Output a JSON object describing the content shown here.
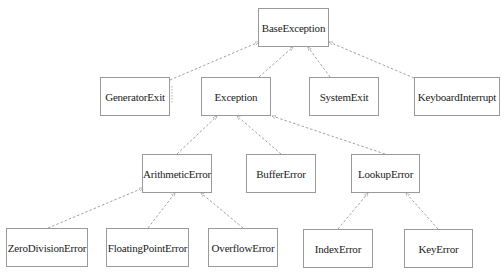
{
  "diagram": {
    "title": "",
    "style": {
      "box_border": "#9a9a9a",
      "edge_color": "#8a8a8a",
      "text_color": "#222222",
      "background": "#ffffff",
      "edge_style": "dashed",
      "arrowhead": "small open triangle at parent"
    },
    "nodes": [
      {
        "id": "BaseException",
        "label": "BaseException",
        "x": 258,
        "y": 8,
        "w": 71,
        "h": 39
      },
      {
        "id": "GeneratorExit",
        "label": "GeneratorExit",
        "x": 100,
        "y": 77,
        "w": 70,
        "h": 39
      },
      {
        "id": "Exception",
        "label": "Exception",
        "x": 201,
        "y": 77,
        "w": 70,
        "h": 39
      },
      {
        "id": "SystemExit",
        "label": "SystemExit",
        "x": 309,
        "y": 77,
        "w": 70,
        "h": 39
      },
      {
        "id": "KeyboardInterrupt",
        "label": "KeyboardInterrupt",
        "x": 414,
        "y": 77,
        "w": 86,
        "h": 39
      },
      {
        "id": "ArithmeticError",
        "label": "ArithmeticError",
        "x": 142,
        "y": 154,
        "w": 70,
        "h": 39
      },
      {
        "id": "BufferError",
        "label": "BufferError",
        "x": 246,
        "y": 154,
        "w": 70,
        "h": 39
      },
      {
        "id": "LookupError",
        "label": "LookupError",
        "x": 351,
        "y": 154,
        "w": 69,
        "h": 39
      },
      {
        "id": "ZeroDivisionError",
        "label": "ZeroDivisionError",
        "x": 6,
        "y": 228,
        "w": 82,
        "h": 39
      },
      {
        "id": "FloatingPointError",
        "label": "FloatingPointError",
        "x": 106,
        "y": 228,
        "w": 83,
        "h": 39
      },
      {
        "id": "OverflowError",
        "label": "OverflowError",
        "x": 208,
        "y": 228,
        "w": 70,
        "h": 39
      },
      {
        "id": "IndexError",
        "label": "IndexError",
        "x": 303,
        "y": 229,
        "w": 70,
        "h": 39
      },
      {
        "id": "KeyError",
        "label": "KeyError",
        "x": 404,
        "y": 229,
        "w": 69,
        "h": 39
      }
    ],
    "edges": [
      {
        "from": "GeneratorExit",
        "to": "BaseException",
        "x1": 170,
        "y1": 80,
        "x2": 259,
        "y2": 42
      },
      {
        "from": "Exception",
        "to": "BaseException",
        "x1": 259,
        "y1": 77,
        "x2": 293,
        "y2": 47
      },
      {
        "from": "SystemExit",
        "to": "BaseException",
        "x1": 330,
        "y1": 77,
        "x2": 308,
        "y2": 47
      },
      {
        "from": "KeyboardInterrupt",
        "to": "BaseException",
        "x1": 414,
        "y1": 78,
        "x2": 329,
        "y2": 42
      },
      {
        "from": "ArithmeticError",
        "to": "Exception",
        "x1": 177,
        "y1": 154,
        "x2": 217,
        "y2": 116
      },
      {
        "from": "BufferError",
        "to": "Exception",
        "x1": 281,
        "y1": 154,
        "x2": 237,
        "y2": 116
      },
      {
        "from": "LookupError",
        "to": "Exception",
        "x1": 385,
        "y1": 154,
        "x2": 272,
        "y2": 116
      },
      {
        "from": "ZeroDivisionError",
        "to": "ArithmeticError",
        "x1": 48,
        "y1": 228,
        "x2": 143,
        "y2": 188
      },
      {
        "from": "FloatingPointError",
        "to": "ArithmeticError",
        "x1": 148,
        "y1": 228,
        "x2": 175,
        "y2": 193
      },
      {
        "from": "OverflowError",
        "to": "ArithmeticError",
        "x1": 243,
        "y1": 228,
        "x2": 201,
        "y2": 193
      },
      {
        "from": "IndexError",
        "to": "LookupError",
        "x1": 338,
        "y1": 229,
        "x2": 368,
        "y2": 193
      },
      {
        "from": "KeyError",
        "to": "LookupError",
        "x1": 438,
        "y1": 229,
        "x2": 406,
        "y2": 193
      }
    ]
  }
}
